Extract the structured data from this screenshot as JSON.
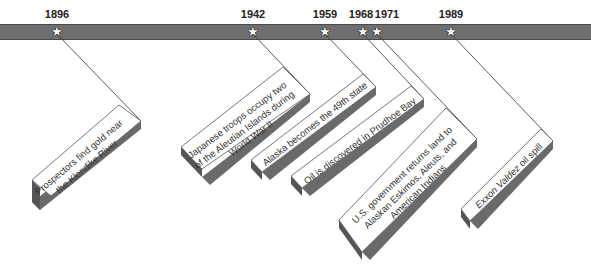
{
  "timeline": {
    "bar_color": "#6f6f6f",
    "events": [
      {
        "year": "1896",
        "text": "Prospectors find gold near the Klondike River"
      },
      {
        "year": "1942",
        "text": "Japanese troops occupy two of the Aleutian Islands during World War II"
      },
      {
        "year": "1959",
        "text": "Alaska becomes the 49th state"
      },
      {
        "year": "1968",
        "text": "Oil is discovered in Prudhoe Bay"
      },
      {
        "year": "1971",
        "text": "U.S. government returns land to Alaskan Eskimos, Aleuts, and American Indians"
      },
      {
        "year": "1989",
        "text_italic": "Exxon Valdez",
        "text": " oil spill"
      }
    ],
    "star_icon": "★"
  }
}
